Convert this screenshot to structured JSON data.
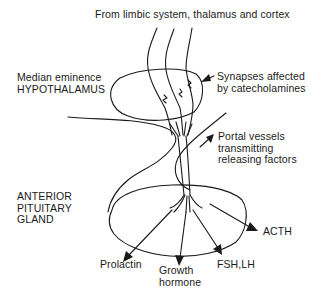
{
  "diagram": {
    "title_top": "From limbic system, thalamus and cortex",
    "median_eminence": {
      "line1": "Median eminence",
      "line2": "HYPOTHALAMUS"
    },
    "synapses": {
      "line1": "Synapses affected",
      "line2": "by catecholamines"
    },
    "portal": {
      "line1": "Portal vessels",
      "line2": "transmitting",
      "line3": "releasing factors"
    },
    "pituitary": {
      "line1": "ANTERIOR",
      "line2": "PITUITARY",
      "line3": "GLAND"
    },
    "outputs": {
      "prolactin": "Prolactin",
      "growth_hormone_line1": "Growth",
      "growth_hormone_line2": "hormone",
      "fsh_lh": "FSH,LH",
      "acth": "ACTH"
    },
    "colors": {
      "ink": "#1a1a1a",
      "background": "#ffffff"
    }
  }
}
